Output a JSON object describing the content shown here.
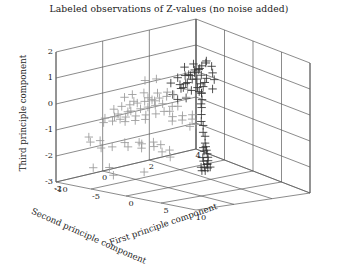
{
  "figure": {
    "title": "Labeled observations of Z-values (no noise added)",
    "background": "#ffffff",
    "frame_color": "#5a5a5a"
  },
  "chart_data": {
    "type": "scatter",
    "title": "Labeled observations of Z-values (no noise added)",
    "projection": "3d",
    "xlabel": "First principle component",
    "ylabel": "Second principle component",
    "zlabel": "Third principle component",
    "xlim": [
      -10,
      10
    ],
    "ylim": [
      -2,
      4
    ],
    "zlim": [
      -3,
      2
    ],
    "xticks": [
      -10,
      -5,
      0,
      5,
      10
    ],
    "yticks": [
      4,
      2,
      0,
      -2
    ],
    "zticks": [
      2,
      1,
      0,
      -1,
      -2,
      -3
    ],
    "xtick_labels": [
      "-10",
      "-5",
      "0",
      "5",
      "10"
    ],
    "ytick_labels": [
      "4",
      "2",
      "0",
      "-2"
    ],
    "ztick_labels": [
      "2",
      "1",
      "0",
      "-1",
      "-2",
      "-3"
    ],
    "grid": true,
    "legend": null,
    "marker": "+",
    "marker_size": 4.2,
    "series": [
      {
        "name": "group-dark",
        "color": "#333333",
        "points": [
          [
            -1.2,
            1.4,
            1.0
          ],
          [
            -0.8,
            1.2,
            1.1
          ],
          [
            -0.5,
            1.5,
            0.9
          ],
          [
            -0.2,
            1.3,
            1.2
          ],
          [
            0.1,
            1.1,
            1.0
          ],
          [
            0.4,
            1.4,
            0.8
          ],
          [
            -1.5,
            1.0,
            0.7
          ],
          [
            -1.0,
            0.9,
            0.6
          ],
          [
            -0.6,
            1.0,
            0.8
          ],
          [
            -0.3,
            0.8,
            0.7
          ],
          [
            0.0,
            0.9,
            0.9
          ],
          [
            0.3,
            1.0,
            0.6
          ],
          [
            0.6,
            1.2,
            0.7
          ],
          [
            0.9,
            1.3,
            0.5
          ],
          [
            1.2,
            1.1,
            0.6
          ],
          [
            -1.8,
            1.3,
            1.3
          ],
          [
            -1.4,
            1.6,
            1.4
          ],
          [
            -0.9,
            1.7,
            1.2
          ],
          [
            -0.4,
            1.6,
            1.3
          ],
          [
            0.2,
            1.5,
            1.1
          ],
          [
            0.7,
            1.6,
            1.0
          ],
          [
            1.1,
            1.4,
            0.9
          ],
          [
            1.5,
            1.2,
            0.8
          ],
          [
            1.9,
            1.0,
            0.6
          ],
          [
            2.3,
            0.9,
            0.4
          ],
          [
            2.8,
            0.7,
            0.3
          ],
          [
            -2.2,
            1.1,
            0.9
          ],
          [
            -2.6,
            0.9,
            0.7
          ],
          [
            -0.1,
            1.8,
            1.5
          ],
          [
            0.5,
            1.9,
            1.4
          ],
          [
            -0.7,
            2.0,
            1.5
          ],
          [
            1.0,
            1.8,
            1.2
          ],
          [
            -1.1,
            1.9,
            1.3
          ],
          [
            1.6,
            1.7,
            1.0
          ],
          [
            -1.9,
            1.8,
            1.1
          ],
          [
            2.0,
            1.5,
            0.7
          ],
          [
            -2.4,
            1.5,
            0.9
          ],
          [
            0.8,
            0.6,
            0.4
          ],
          [
            -0.2,
            0.5,
            0.3
          ],
          [
            -1.3,
            0.6,
            0.4
          ],
          [
            3.2,
            0.6,
            0.2
          ],
          [
            3.8,
            0.4,
            0.0
          ],
          [
            4.4,
            0.2,
            -0.2
          ],
          [
            5.0,
            0.1,
            -0.3
          ],
          [
            5.6,
            -0.1,
            -0.5
          ],
          [
            6.2,
            -0.2,
            -0.6
          ],
          [
            6.8,
            -0.4,
            -0.8
          ],
          [
            7.2,
            -0.5,
            -0.9
          ],
          [
            7.6,
            -0.6,
            -1.0
          ],
          [
            8.0,
            -0.7,
            -1.1
          ],
          [
            8.4,
            -0.8,
            -1.2
          ],
          [
            8.7,
            -0.9,
            -1.3
          ],
          [
            8.9,
            -1.0,
            -1.4
          ],
          [
            9.1,
            -1.1,
            -1.4
          ],
          [
            9.3,
            -1.0,
            -1.5
          ],
          [
            9.0,
            -1.2,
            -1.5
          ],
          [
            8.6,
            -1.1,
            -1.3
          ],
          [
            8.2,
            -1.0,
            -1.2
          ],
          [
            7.8,
            -0.8,
            -1.0
          ],
          [
            7.4,
            -0.7,
            -0.9
          ],
          [
            9.4,
            -1.3,
            -1.6
          ],
          [
            9.2,
            -1.4,
            -1.6
          ],
          [
            8.8,
            -1.3,
            -1.5
          ],
          [
            9.5,
            -1.2,
            -1.5
          ]
        ]
      },
      {
        "name": "group-light",
        "color": "#9a9a9a",
        "points": [
          [
            -9.0,
            0.2,
            -0.6
          ],
          [
            -8.5,
            0.4,
            -0.5
          ],
          [
            -8.0,
            0.1,
            -0.7
          ],
          [
            -7.6,
            0.5,
            -0.4
          ],
          [
            -7.2,
            0.3,
            -0.6
          ],
          [
            -6.8,
            0.6,
            -0.3
          ],
          [
            -6.4,
            0.2,
            -0.5
          ],
          [
            -6.0,
            0.7,
            -0.2
          ],
          [
            -5.6,
            0.4,
            -0.4
          ],
          [
            -5.2,
            0.8,
            -0.1
          ],
          [
            -4.8,
            0.5,
            -0.3
          ],
          [
            -4.4,
            0.9,
            0.0
          ],
          [
            -4.0,
            0.6,
            -0.2
          ],
          [
            -3.6,
            1.0,
            0.1
          ],
          [
            -3.2,
            0.7,
            -0.1
          ],
          [
            -2.8,
            1.1,
            0.2
          ],
          [
            -9.3,
            -0.1,
            -0.9
          ],
          [
            -8.8,
            -0.3,
            -1.0
          ],
          [
            -8.2,
            0.0,
            -0.8
          ],
          [
            -7.8,
            -0.2,
            -0.9
          ],
          [
            -7.0,
            -0.1,
            -0.8
          ],
          [
            -6.5,
            0.0,
            -0.7
          ],
          [
            -5.9,
            -0.2,
            -0.8
          ],
          [
            -5.3,
            0.1,
            -0.6
          ],
          [
            -4.7,
            -0.1,
            -0.7
          ],
          [
            -4.1,
            0.2,
            -0.5
          ],
          [
            -3.5,
            0.0,
            -0.6
          ],
          [
            -2.9,
            0.3,
            -0.4
          ],
          [
            -2.3,
            0.5,
            -0.3
          ],
          [
            -1.7,
            0.7,
            -0.1
          ],
          [
            -1.1,
            0.4,
            -0.2
          ],
          [
            -0.5,
            0.6,
            0.0
          ],
          [
            -9.5,
            0.8,
            -0.3
          ],
          [
            -9.0,
            1.0,
            -0.2
          ],
          [
            -8.4,
            0.9,
            -0.4
          ],
          [
            -7.9,
            1.2,
            -0.1
          ],
          [
            -6.9,
            1.1,
            -0.2
          ],
          [
            -6.1,
            1.3,
            0.0
          ],
          [
            -5.5,
            1.0,
            -0.2
          ],
          [
            -4.9,
            1.4,
            0.1
          ],
          [
            -8.6,
            -1.0,
            -1.4
          ],
          [
            -7.7,
            -1.2,
            -1.5
          ],
          [
            -6.6,
            -1.1,
            -1.4
          ],
          [
            -5.8,
            -1.3,
            -1.6
          ],
          [
            -4.5,
            -1.2,
            -1.5
          ],
          [
            -3.3,
            -1.0,
            -1.3
          ],
          [
            -2.5,
            -1.1,
            -1.4
          ],
          [
            -1.5,
            -0.9,
            -1.2
          ],
          [
            0.0,
            0.2,
            -0.3
          ],
          [
            0.6,
            0.0,
            -0.4
          ],
          [
            1.2,
            0.3,
            -0.2
          ],
          [
            1.8,
            0.1,
            -0.3
          ],
          [
            2.4,
            0.4,
            -0.1
          ],
          [
            3.0,
            0.2,
            -0.2
          ],
          [
            3.6,
            -0.1,
            -0.4
          ],
          [
            4.2,
            0.0,
            -0.3
          ],
          [
            0.3,
            -0.8,
            -1.1
          ],
          [
            1.0,
            -1.0,
            -1.2
          ],
          [
            1.7,
            -0.9,
            -1.1
          ],
          [
            2.5,
            -1.1,
            -1.3
          ],
          [
            3.3,
            -1.0,
            -1.2
          ],
          [
            4.0,
            -1.2,
            -1.4
          ],
          [
            -0.8,
            -1.0,
            -1.2
          ],
          [
            -0.2,
            -1.2,
            -1.3
          ],
          [
            -3.0,
            -1.8,
            -2.1
          ],
          [
            -1.8,
            -2.0,
            -2.3
          ],
          [
            -5.0,
            -1.9,
            -2.2
          ],
          [
            2.0,
            -1.8,
            -2.0
          ],
          [
            -9.2,
            1.6,
            0.2
          ],
          [
            -8.1,
            1.8,
            0.3
          ],
          [
            -2.0,
            1.5,
            0.4
          ],
          [
            -1.2,
            1.2,
            0.2
          ]
        ]
      }
    ]
  },
  "axes": {
    "z": {
      "label": "Third principle component",
      "ticks": [
        "2",
        "1",
        "0",
        "-1",
        "-2",
        "-3"
      ]
    },
    "y": {
      "label": "Second principle component",
      "ticks": [
        "4",
        "2",
        "0",
        "-2"
      ]
    },
    "x": {
      "label": "First principle component",
      "ticks": [
        "-10",
        "-5",
        "0",
        "5",
        "10"
      ]
    }
  }
}
